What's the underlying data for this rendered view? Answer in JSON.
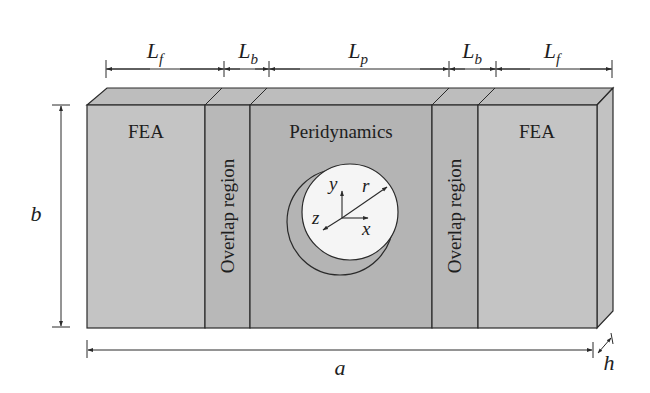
{
  "diagram": {
    "type": "plate-with-hole-schematic",
    "colors": {
      "background": "#ffffff",
      "fea_region": "#c4c4c4",
      "overlap_region": "#b8b8b8",
      "peridynamics_region": "#b4b4b4",
      "top_face": "#bdbdbd",
      "side_face": "#c2c2c2",
      "hole": "#f5f5f5",
      "line": "#2a2a2a"
    },
    "regions": [
      {
        "id": "fea-left",
        "label": "FEA",
        "orientation": "horizontal"
      },
      {
        "id": "overlap-left",
        "label": "Overlap region",
        "orientation": "vertical"
      },
      {
        "id": "peridynamics",
        "label": "Peridynamics",
        "orientation": "horizontal"
      },
      {
        "id": "overlap-right",
        "label": "Overlap region",
        "orientation": "vertical"
      },
      {
        "id": "fea-right",
        "label": "FEA",
        "orientation": "horizontal"
      }
    ],
    "top_dimensions": [
      {
        "symbol": "L",
        "subscript": "f"
      },
      {
        "symbol": "L",
        "subscript": "b"
      },
      {
        "symbol": "L",
        "subscript": "p"
      },
      {
        "symbol": "L",
        "subscript": "b"
      },
      {
        "symbol": "L",
        "subscript": "f"
      }
    ],
    "height_dimension": "b",
    "width_dimension": "a",
    "thickness_dimension": "h",
    "hole": {
      "radius_label": "r",
      "axes": {
        "x": "x",
        "y": "y",
        "z": "z"
      }
    }
  }
}
